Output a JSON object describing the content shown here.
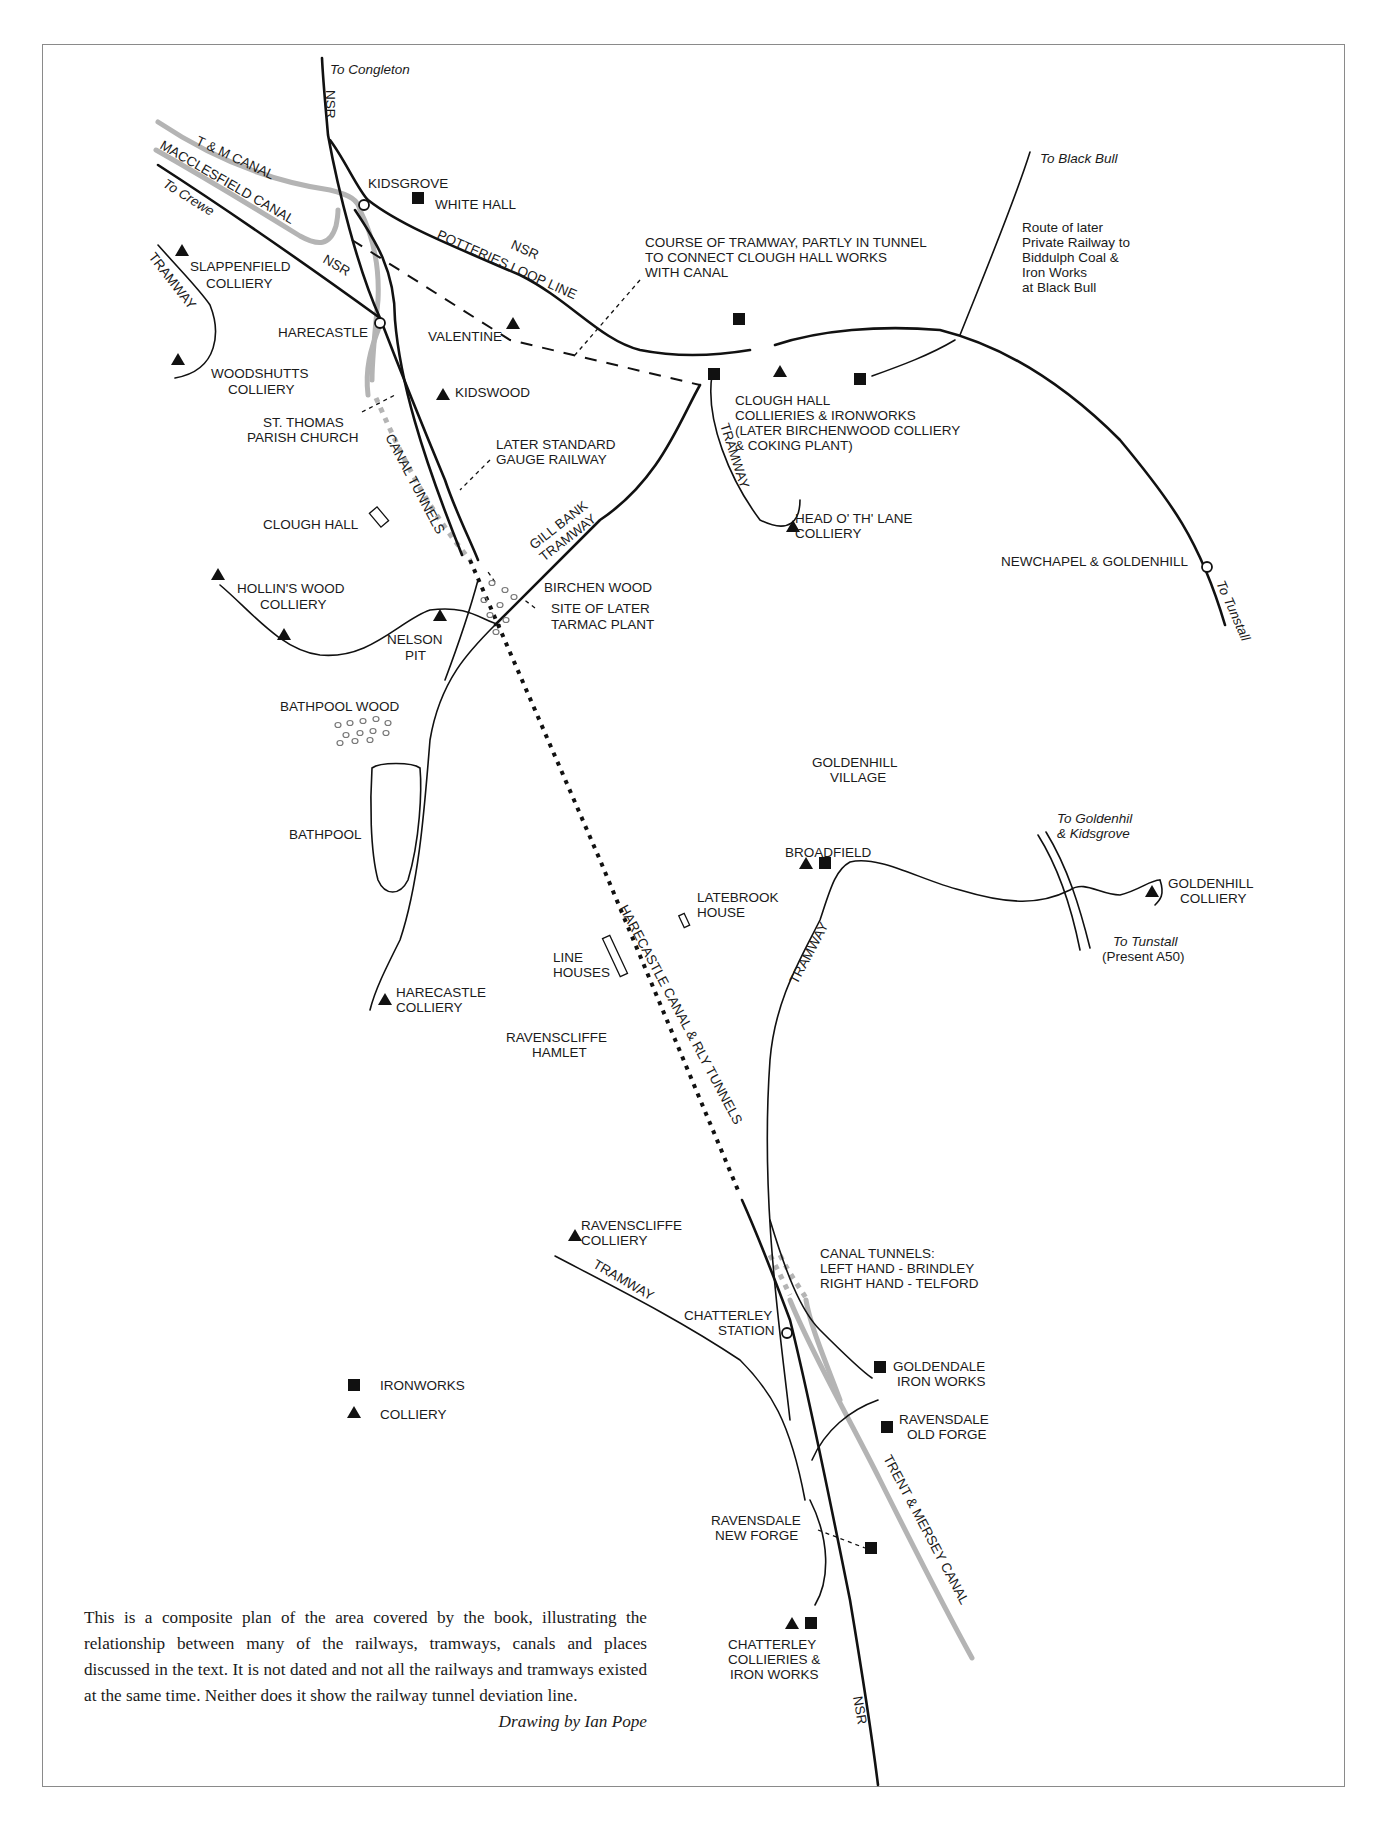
{
  "map": {
    "routes": {
      "to_congleton": "To Congleton",
      "to_crewe": "To Crewe",
      "to_black_bull": "To Black Bull",
      "to_tunstall_rail": "To Tunstall",
      "to_goldenhill_kidsgrove_1": "To Goldenhil",
      "to_goldenhill_kidsgrove_2": "& Kidsgrove",
      "to_tunstall_road_1": "To Tunstall",
      "to_tunstall_road_2": "(Present A50)"
    },
    "lines": {
      "nsr_north": "NSR",
      "nsr_crewe": "NSR",
      "nsr_loop": "NSR",
      "potteries_loop": "POTTERIES LOOP LINE",
      "nsr_south": "NSR",
      "tm_canal": "T & M  CANAL",
      "macclesfield_canal": "MACCLESFIELD CANAL",
      "tramway_slappenfield": "TRAMWAY",
      "tramway_clough": "TRAMWAY",
      "gill_bank_1": "GILL BANK",
      "gill_bank_2": "TRAMWAY",
      "canal_tunnels": "CANAL TUNNELS",
      "harecastle_tunnels": "HARECASTLE CANAL & RLY TUNNELS",
      "tramway_broadfield": "TRAMWAY",
      "tramway_ravenscliffe": "TRAMWAY",
      "trent_mersey": "TRENT & MERSEY CANAL"
    },
    "places": {
      "kidsgrove": "KIDSGROVE",
      "white_hall": "WHITE HALL",
      "slappenfield_1": "SLAPPENFIELD",
      "slappenfield_2": "COLLIERY",
      "harecastle": "HARECASTLE",
      "valentine": "VALENTINE",
      "woodshutts_1": "WOODSHUTTS",
      "woodshutts_2": "COLLIERY",
      "kidswood": "KIDSWOOD",
      "st_thomas_1": "ST. THOMAS",
      "st_thomas_2": "PARISH CHURCH",
      "clough_hall": "CLOUGH HALL",
      "hollins_1": "HOLLIN'S WOOD",
      "hollins_2": "COLLIERY",
      "nelson_1": "NELSON",
      "nelson_2": "PIT",
      "birchen_wood": "BIRCHEN WOOD",
      "tarmac_1": "SITE OF LATER",
      "tarmac_2": "TARMAC PLANT",
      "bathpool_wood": "BATHPOOL WOOD",
      "bathpool": "BATHPOOL",
      "harecastle_colliery_1": "HARECASTLE",
      "harecastle_colliery_2": "COLLIERY",
      "line_houses_1": "LINE",
      "line_houses_2": "HOUSES",
      "latebrook_1": "LATEBROOK",
      "latebrook_2": "HOUSE",
      "ravenscliffe_hamlet_1": "RAVENSCLIFFE",
      "ravenscliffe_hamlet_2": "HAMLET",
      "goldenhill_village_1": "GOLDENHILL",
      "goldenhill_village_2": "VILLAGE",
      "broadfield": "BROADFIELD",
      "goldenhill_colliery_1": "GOLDENHILL",
      "goldenhill_colliery_2": "COLLIERY",
      "clough_works_1": "CLOUGH HALL",
      "clough_works_2": "COLLIERIES & IRONWORKS",
      "clough_works_3": "(LATER BIRCHENWOOD COLLIERY",
      "clough_works_4": "& COKING PLANT)",
      "head_o_th_lane_1": "HEAD O' TH' LANE",
      "head_o_th_lane_2": "COLLIERY",
      "newchapel": "NEWCHAPEL & GOLDENHILL",
      "ravenscliffe_colliery_1": "RAVENSCLIFFE",
      "ravenscliffe_colliery_2": "COLLIERY",
      "chatterley_station_1": "CHATTERLEY",
      "chatterley_station_2": "STATION",
      "goldendale_1": "GOLDENDALE",
      "goldendale_2": "IRON WORKS",
      "ravensdale_old_1": "RAVENSDALE",
      "ravensdale_old_2": "OLD FORGE",
      "ravensdale_new_1": "RAVENSDALE",
      "ravensdale_new_2": "NEW FORGE",
      "chatterley_works_1": "CHATTERLEY",
      "chatterley_works_2": "COLLIERIES &",
      "chatterley_works_3": "IRON WORKS"
    },
    "notes": {
      "course_tramway_1": "COURSE OF TRAMWAY, PARTLY IN TUNNEL",
      "course_tramway_2": "TO CONNECT CLOUGH HALL WORKS",
      "course_tramway_3": "WITH CANAL",
      "later_gauge_1": "LATER STANDARD",
      "later_gauge_2": "GAUGE RAILWAY",
      "biddulph_1": "Route of later",
      "biddulph_2": "Private Railway to",
      "biddulph_3": "Biddulph Coal &",
      "biddulph_4": "Iron Works",
      "biddulph_5": "at Black Bull",
      "canal_tunnels_1": "CANAL TUNNELS:",
      "canal_tunnels_2": "LEFT HAND - BRINDLEY",
      "canal_tunnels_3": "RIGHT HAND - TELFORD"
    },
    "legend": {
      "ironworks": "IRONWORKS",
      "colliery": "COLLIERY"
    },
    "colors": {
      "line": "#111111",
      "canal": "#b4b4b4",
      "frame": "#8a8a8a"
    }
  },
  "caption": {
    "text": "This is a composite plan of the area covered by the book, illustrating the relationship between many of the railways, tramways, canals and places discussed in the text. It is not dated and not all the railways and tramways existed at the same time. Neither does it show the railway tunnel deviation line.",
    "credit": "Drawing by Ian Pope"
  }
}
